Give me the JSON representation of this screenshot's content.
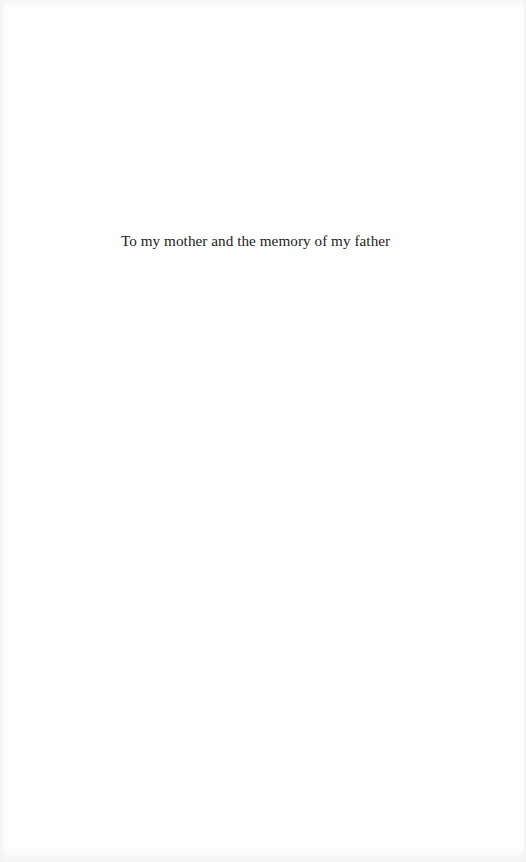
{
  "page": {
    "type": "dedication",
    "dedication_text": "To my mother and the memory of my father"
  },
  "colors": {
    "background": "#fefefe",
    "text": "#1c1c1c"
  }
}
